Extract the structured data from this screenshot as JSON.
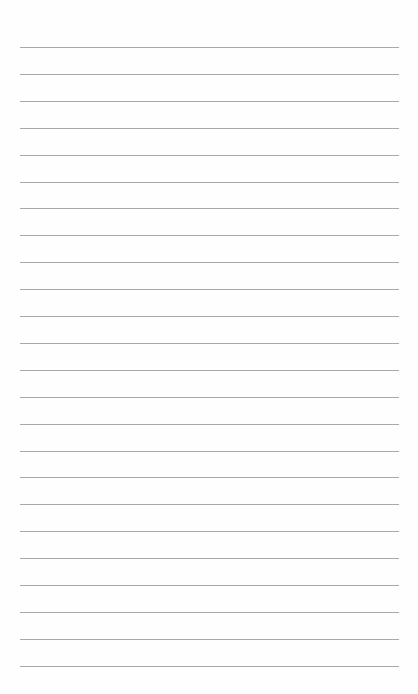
{
  "document": {
    "type": "lined-paper",
    "line_count": 24,
    "first_line_y": 47,
    "line_spacing": 26.9,
    "line_left": 20,
    "line_width": 379,
    "line_color": "#9a9a9a",
    "background_color": "#fefefe",
    "text_content": []
  }
}
